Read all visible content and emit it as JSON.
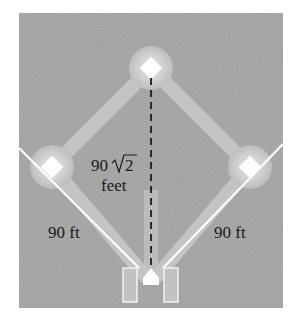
{
  "diagram": {
    "colors": {
      "field": "#a9a9a9",
      "path": "#c4c4c4",
      "glow": "#cfcfcf",
      "base": "#ffffff",
      "foul_line": "#ffffff",
      "dashed_line": "#2a2a2a",
      "text": "#1a1a1a"
    },
    "bases": [
      {
        "name": "second-base",
        "x": 151,
        "y": 68
      },
      {
        "name": "first-base",
        "x": 250,
        "y": 167
      },
      {
        "name": "third-base",
        "x": 52,
        "y": 167
      },
      {
        "name": "home-plate",
        "x": 151,
        "y": 286
      }
    ],
    "labels": {
      "diagonal_value": "90",
      "diagonal_radicand": "2",
      "diagonal_unit": "feet",
      "left_side": "90 ft",
      "right_side": "90 ft"
    }
  }
}
